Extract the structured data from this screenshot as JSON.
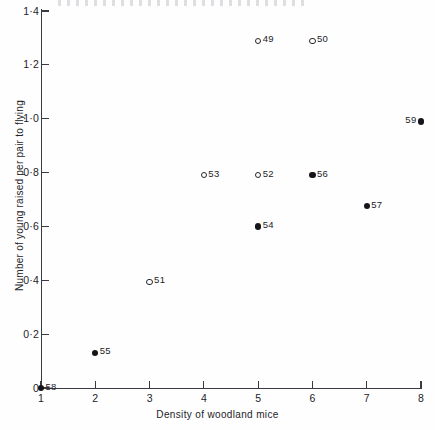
{
  "chart_data": {
    "type": "scatter",
    "title": "",
    "xlabel": "Density of woodland mice",
    "ylabel": "Number of young raised per pair to flying",
    "xlim": [
      1,
      8
    ],
    "ylim": [
      0,
      1.4
    ],
    "grid": false,
    "legend": null,
    "xticks": [
      {
        "value": 1,
        "label": "1"
      },
      {
        "value": 2,
        "label": "2"
      },
      {
        "value": 3,
        "label": "3"
      },
      {
        "value": 4,
        "label": "4"
      },
      {
        "value": 5,
        "label": "5"
      },
      {
        "value": 6,
        "label": "6"
      },
      {
        "value": 7,
        "label": "7"
      },
      {
        "value": 8,
        "label": "8"
      }
    ],
    "yticks": [
      {
        "value": 0.0,
        "label": "0"
      },
      {
        "value": 0.2,
        "label": "0·2"
      },
      {
        "value": 0.4,
        "label": "0·4"
      },
      {
        "value": 0.6,
        "label": "0·6"
      },
      {
        "value": 0.8,
        "label": "0·8"
      },
      {
        "value": 1.0,
        "label": "1·0"
      },
      {
        "value": 1.2,
        "label": "1·2"
      },
      {
        "value": 1.4,
        "label": "1·4"
      }
    ],
    "marker_styles": {
      "open": "open circle",
      "filled": "filled circle"
    },
    "points": [
      {
        "label": "49",
        "x": 5.0,
        "y": 1.29,
        "marker": "open",
        "label_side": "right"
      },
      {
        "label": "50",
        "x": 6.0,
        "y": 1.29,
        "marker": "open",
        "label_side": "right"
      },
      {
        "label": "59",
        "x": 8.0,
        "y": 0.99,
        "marker": "filled",
        "label_side": "left"
      },
      {
        "label": "53",
        "x": 4.0,
        "y": 0.79,
        "marker": "open",
        "label_side": "right"
      },
      {
        "label": "52",
        "x": 5.0,
        "y": 0.79,
        "marker": "open",
        "label_side": "right"
      },
      {
        "label": "56",
        "x": 6.0,
        "y": 0.79,
        "marker": "filled",
        "label_side": "right"
      },
      {
        "label": "57",
        "x": 7.0,
        "y": 0.675,
        "marker": "filled",
        "label_side": "right"
      },
      {
        "label": "54",
        "x": 5.0,
        "y": 0.6,
        "marker": "filled",
        "label_side": "right"
      },
      {
        "label": "51",
        "x": 3.0,
        "y": 0.395,
        "marker": "open",
        "label_side": "right"
      },
      {
        "label": "55",
        "x": 2.0,
        "y": 0.13,
        "marker": "filled",
        "label_side": "right"
      },
      {
        "label": "58",
        "x": 1.0,
        "y": 0.0,
        "marker": "filled",
        "label_side": "right"
      }
    ]
  }
}
